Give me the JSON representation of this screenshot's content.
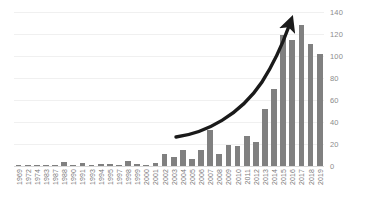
{
  "chart_data": {
    "type": "bar",
    "title": "",
    "subtitle": "",
    "xlabel": "",
    "ylabel": "",
    "ylim": [
      0,
      140
    ],
    "yticks": [
      0,
      20,
      40,
      60,
      80,
      100,
      120,
      140
    ],
    "grid": true,
    "legend": null,
    "legend_position": "none",
    "bar_color": "#808080",
    "categories": [
      "1969",
      "1972",
      "1974",
      "1983",
      "1987",
      "1988",
      "1990",
      "1991",
      "1993",
      "1994",
      "1995",
      "1997",
      "1998",
      "1999",
      "2000",
      "2001",
      "2002",
      "2003",
      "2004",
      "2005",
      "2006",
      "2007",
      "2008",
      "2009",
      "2010",
      "2011",
      "2012",
      "2013",
      "2014",
      "2015",
      "2016",
      "2017",
      "2018",
      "2019"
    ],
    "values": [
      1,
      1,
      1,
      1,
      1,
      4,
      1,
      3,
      1,
      2,
      2,
      1,
      5,
      2,
      1,
      3,
      11,
      8,
      15,
      6,
      15,
      33,
      11,
      19,
      18,
      27,
      22,
      52,
      70,
      119,
      115,
      128,
      111,
      102
    ],
    "annotations": [
      {
        "name": "growth-trend-arrow",
        "type": "curved-arrow",
        "color": "#1a1a1a",
        "description": "Upward curved arrow showing exponential growth trend",
        "start": [
          175,
          137
        ],
        "end": [
          291,
          20
        ]
      }
    ]
  }
}
